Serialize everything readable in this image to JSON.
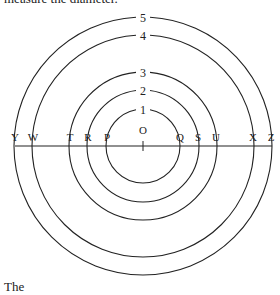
{
  "captions": {
    "top": "measure the diameter.",
    "bottom": "The"
  },
  "diagram": {
    "stroke_color": "#222222",
    "center": {
      "label": "O",
      "x": 143,
      "y": 146
    },
    "baseline": {
      "x1": 15,
      "x2": 272,
      "y": 146
    },
    "points": [
      {
        "label": "Y",
        "x": 15
      },
      {
        "label": "W",
        "x": 33
      },
      {
        "label": "T",
        "x": 70
      },
      {
        "label": "R",
        "x": 88
      },
      {
        "label": "P",
        "x": 107
      },
      {
        "label": "O",
        "x": 143
      },
      {
        "label": "Q",
        "x": 180
      },
      {
        "label": "S",
        "x": 198
      },
      {
        "label": "U",
        "x": 216
      },
      {
        "label": "X",
        "x": 253
      },
      {
        "label": "Z",
        "x": 271
      }
    ],
    "circles": [
      {
        "label": "1",
        "r": 37,
        "ends": [
          "P",
          "Q"
        ]
      },
      {
        "label": "2",
        "r": 56,
        "ends": [
          "R",
          "S"
        ]
      },
      {
        "label": "3",
        "r": 74,
        "ends": [
          "T",
          "U"
        ]
      },
      {
        "label": "4",
        "r": 111,
        "ends": [
          "W",
          "X"
        ]
      },
      {
        "label": "5",
        "r": 129,
        "ends": [
          "Y",
          "Z"
        ]
      }
    ]
  }
}
